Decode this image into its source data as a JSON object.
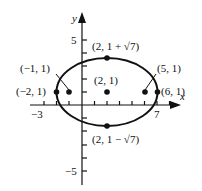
{
  "figure": {
    "type": "ellipse-graph",
    "equation_center": [
      2,
      1
    ],
    "semi_major": 4,
    "semi_minor_label": "√7",
    "axes": {
      "x_label": "x",
      "y_label": "y",
      "x_tick_labels": {
        "min": "−3",
        "max": "7"
      },
      "y_tick_labels": {
        "max": "5",
        "min": "−5"
      }
    },
    "points": [
      {
        "label": "(2, 1 + √7)",
        "name": "top-vertex"
      },
      {
        "label": "(2, 1)",
        "name": "center"
      },
      {
        "label": "(2, 1 − √7)",
        "name": "bottom-vertex"
      },
      {
        "label": "(−2, 1)",
        "name": "left-vertex"
      },
      {
        "label": "(6, 1)",
        "name": "right-vertex"
      },
      {
        "label": "(−1, 1)",
        "name": "left-focus"
      },
      {
        "label": "(5, 1)",
        "name": "right-focus"
      }
    ],
    "colors": {
      "ink": "#111111",
      "background": "#ffffff"
    }
  }
}
